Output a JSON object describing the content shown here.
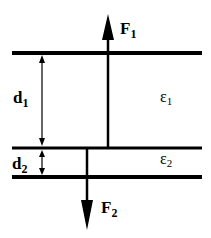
{
  "diagram": {
    "labels": {
      "F1": {
        "main": "F",
        "sub": "1"
      },
      "F2": {
        "main": "F",
        "sub": "2"
      },
      "d1": {
        "main": "d",
        "sub": "1"
      },
      "d2": {
        "main": "d",
        "sub": "2"
      },
      "eps1": {
        "main": "ε",
        "sub": "1"
      },
      "eps2": {
        "main": "ε",
        "sub": "2"
      }
    },
    "colors": {
      "line": "#000000",
      "background": "#ffffff"
    }
  }
}
